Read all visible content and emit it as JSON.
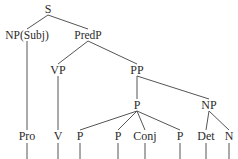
{
  "figure": {
    "type": "syntax-tree",
    "width": 238,
    "height": 159,
    "line_color": "#555555",
    "text_color": "#2b2b2b",
    "background_color": "#ffffff"
  },
  "nodes": [
    {
      "id": "s",
      "label": "S",
      "x": 48,
      "y": 9
    },
    {
      "id": "npsubj",
      "label": "NP(Subj)",
      "x": 27,
      "y": 35
    },
    {
      "id": "predp",
      "label": "PredP",
      "x": 88,
      "y": 35
    },
    {
      "id": "vp",
      "label": "VP",
      "x": 58,
      "y": 70
    },
    {
      "id": "pp",
      "label": "PP",
      "x": 137,
      "y": 70
    },
    {
      "id": "p_head",
      "label": "P",
      "x": 137,
      "y": 105
    },
    {
      "id": "np_obj",
      "label": "NP",
      "x": 209,
      "y": 105
    },
    {
      "id": "pro",
      "label": "Pro",
      "x": 27,
      "y": 136
    },
    {
      "id": "v",
      "label": "V",
      "x": 58,
      "y": 136
    },
    {
      "id": "p1",
      "label": "P",
      "x": 80,
      "y": 136
    },
    {
      "id": "p2",
      "label": "P",
      "x": 118,
      "y": 136
    },
    {
      "id": "conj",
      "label": "Conj",
      "x": 145,
      "y": 136
    },
    {
      "id": "p3",
      "label": "P",
      "x": 180,
      "y": 136
    },
    {
      "id": "det",
      "label": "Det",
      "x": 206,
      "y": 136
    },
    {
      "id": "n",
      "label": "N",
      "x": 229,
      "y": 136
    }
  ],
  "edges": [
    {
      "from": "s",
      "to": "npsubj"
    },
    {
      "from": "s",
      "to": "predp"
    },
    {
      "from": "npsubj",
      "to": "pro"
    },
    {
      "from": "predp",
      "to": "vp"
    },
    {
      "from": "predp",
      "to": "pp"
    },
    {
      "from": "vp",
      "to": "v"
    },
    {
      "from": "pp",
      "to": "p_head"
    },
    {
      "from": "pp",
      "to": "np_obj"
    },
    {
      "from": "p_head",
      "to": "p1"
    },
    {
      "from": "p_head",
      "to": "p2"
    },
    {
      "from": "p_head",
      "to": "conj"
    },
    {
      "from": "p_head",
      "to": "p3"
    },
    {
      "from": "np_obj",
      "to": "det"
    },
    {
      "from": "np_obj",
      "to": "n"
    }
  ],
  "terminal_stems": [
    {
      "id": "stem-pro",
      "x": 27
    },
    {
      "id": "stem-v",
      "x": 58
    },
    {
      "id": "stem-p1",
      "x": 80
    },
    {
      "id": "stem-p2",
      "x": 118
    },
    {
      "id": "stem-conj",
      "x": 145
    },
    {
      "id": "stem-p3",
      "x": 180
    },
    {
      "id": "stem-det",
      "x": 206
    },
    {
      "id": "stem-n",
      "x": 229
    }
  ]
}
